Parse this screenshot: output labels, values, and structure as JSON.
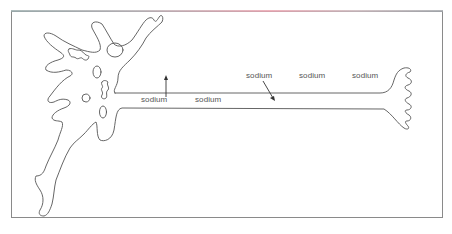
{
  "figure": {
    "type": "neuron diagram",
    "labels": [
      {
        "id": "sodium-1",
        "text": "sodium",
        "x": 141,
        "y": 95
      },
      {
        "id": "sodium-2",
        "text": "sodium",
        "x": 195,
        "y": 95
      },
      {
        "id": "sodium-3",
        "text": "sodium",
        "x": 246,
        "y": 71
      },
      {
        "id": "sodium-4",
        "text": "sodium",
        "x": 299,
        "y": 71
      },
      {
        "id": "sodium-5",
        "text": "sodium",
        "x": 352,
        "y": 71
      }
    ],
    "arrows": [
      {
        "id": "arrow-up",
        "direction": "up",
        "from": [
          166,
          97
        ],
        "to": [
          166,
          76
        ]
      },
      {
        "id": "arrow-down-right",
        "direction": "down-right",
        "from": [
          263,
          81
        ],
        "to": [
          275,
          101
        ]
      }
    ],
    "colors": {
      "line": "#555555",
      "frame": "#8a8a8a",
      "label": "#555555"
    }
  }
}
